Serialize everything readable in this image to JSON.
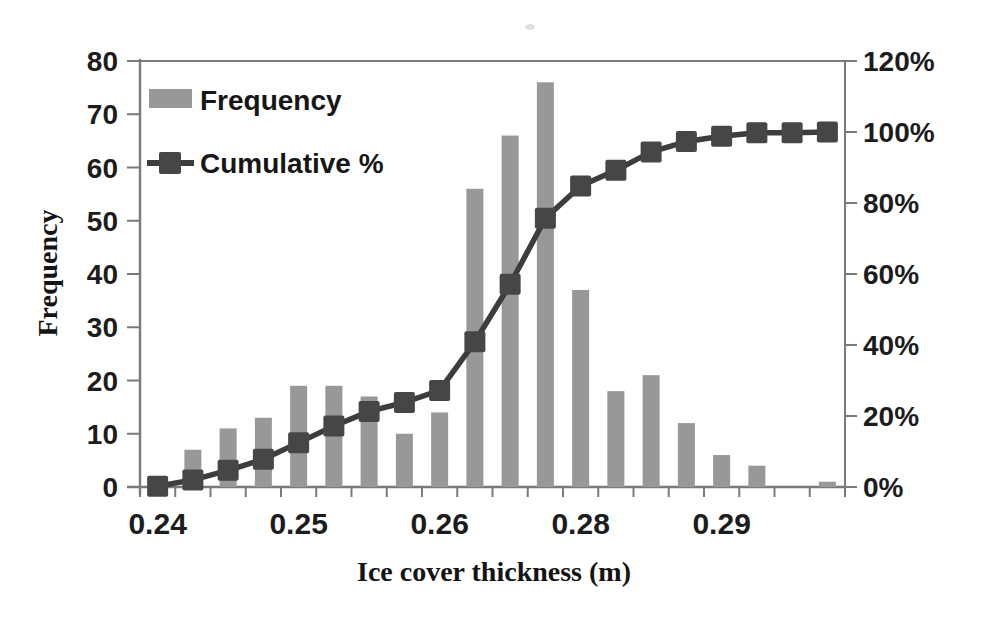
{
  "chart_data": {
    "type": "bar",
    "subtype": "pareto-histogram-with-cumulative-line",
    "title": "",
    "xlabel": "Ice cover thickness (m)",
    "ylabel": "Frequency",
    "categories_count": 20,
    "x_tick_labels": [
      {
        "index": 0,
        "label": "0.24"
      },
      {
        "index": 4,
        "label": "0.25"
      },
      {
        "index": 8,
        "label": "0.26"
      },
      {
        "index": 12,
        "label": "0.28"
      },
      {
        "index": 16,
        "label": "0.29"
      }
    ],
    "series": [
      {
        "name": "Frequency",
        "type": "bar",
        "axis": "left",
        "values": [
          1,
          7,
          11,
          13,
          19,
          19,
          17,
          10,
          14,
          56,
          66,
          76,
          37,
          18,
          21,
          12,
          6,
          4,
          0,
          1
        ]
      },
      {
        "name": "Cumulative %",
        "type": "line",
        "axis": "right",
        "marker": "square",
        "values_pct": [
          0.2,
          2.0,
          4.7,
          7.8,
          12.5,
          17.2,
          21.3,
          23.8,
          27.2,
          40.9,
          57.1,
          75.7,
          84.8,
          89.2,
          94.4,
          97.3,
          98.8,
          99.8,
          99.8,
          100
        ]
      }
    ],
    "left_axis": {
      "min": 0,
      "max": 80,
      "step": 10,
      "tick_labels": [
        "0",
        "10",
        "20",
        "30",
        "40",
        "50",
        "60",
        "70",
        "80"
      ]
    },
    "right_axis": {
      "min": 0,
      "max": 120,
      "step": 20,
      "tick_labels": [
        "0%",
        "20%",
        "40%",
        "60%",
        "80%",
        "100%",
        "120%"
      ]
    },
    "legend": {
      "position": "top-left-inside",
      "items": [
        "Frequency",
        "Cumulative %"
      ]
    },
    "grid": "top-border-only"
  },
  "style": {
    "bar_color": "#989898",
    "line_color": "#3d3d3d",
    "marker_color": "#464646",
    "axis_color": "#7a7a7a",
    "text_color": "#1c1c1c",
    "background": "#ffffff"
  }
}
